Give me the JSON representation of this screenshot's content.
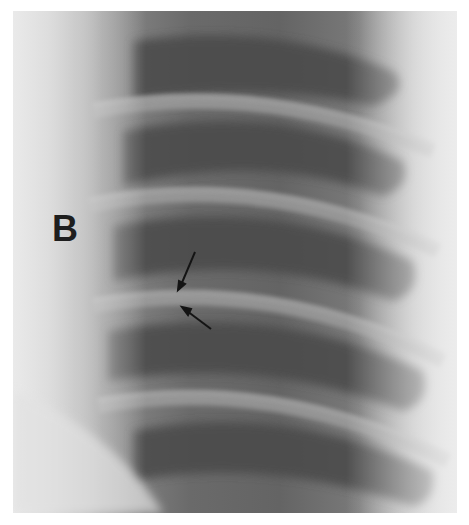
{
  "figure": {
    "panel_label": "B",
    "annotations": [
      {
        "type": "arrow",
        "direction": "down-left",
        "target": "lesion-upper"
      },
      {
        "type": "arrow",
        "direction": "up-left",
        "target": "lesion-lower"
      }
    ],
    "colors": {
      "background": "#ffffff",
      "soft_tissue_light": "#dcdcdc",
      "lung_dark": "#4a4a4a",
      "rib_light": "#9a9a9a",
      "label": "#1e1e1e"
    }
  }
}
